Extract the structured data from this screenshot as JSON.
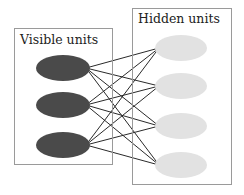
{
  "diagram": {
    "type": "bipartite-network",
    "visible_layer": {
      "label": "Visible units",
      "box": {
        "x": 14,
        "y": 28,
        "w": 98,
        "h": 136
      },
      "unit_color": "#4a4a4a",
      "units": [
        {
          "cx": 63,
          "cy": 68
        },
        {
          "cx": 63,
          "cy": 105
        },
        {
          "cx": 63,
          "cy": 145
        }
      ],
      "rx": 27,
      "ry": 13
    },
    "hidden_layer": {
      "label": "Hidden units",
      "box": {
        "x": 132,
        "y": 8,
        "w": 99,
        "h": 176
      },
      "unit_color": "#e2e2e2",
      "units": [
        {
          "cx": 181,
          "cy": 48
        },
        {
          "cx": 181,
          "cy": 86
        },
        {
          "cx": 181,
          "cy": 126
        },
        {
          "cx": 181,
          "cy": 165
        }
      ],
      "rx": 26,
      "ry": 13
    },
    "edges": "fully-connected",
    "edge_color": "#2a2a2a",
    "box_color": "#9a9a9a"
  }
}
